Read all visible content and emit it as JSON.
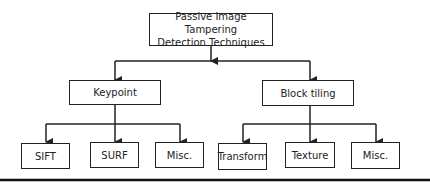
{
  "diagram": {
    "root": {
      "label_line1": "Passive Image Tampering",
      "label_line2": "Detection Techniques"
    },
    "categories": [
      {
        "label": "Keypoint",
        "children": [
          "SIFT",
          "SURF",
          "Misc."
        ]
      },
      {
        "label": "Block tiling",
        "children": [
          "Transform",
          "Texture",
          "Misc."
        ]
      }
    ],
    "colors": {
      "stroke": "#222222",
      "background": "#ffffff",
      "text": "#222222"
    }
  }
}
